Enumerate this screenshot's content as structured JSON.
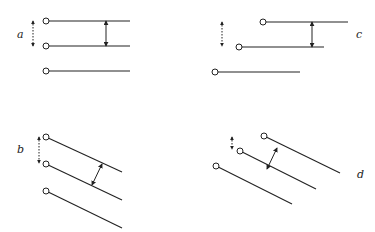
{
  "panels": [
    {
      "id": "a",
      "label": "a",
      "orientation": "horizontal",
      "offset": "aligned",
      "pins": [
        [
          46,
          21,
          130,
          21
        ],
        [
          46,
          46,
          130,
          46
        ],
        [
          46,
          71,
          130,
          71
        ]
      ],
      "dotted_arrow": [
        33,
        21,
        33,
        46
      ],
      "arrow": [
        106,
        21,
        106,
        46
      ],
      "label_pos": [
        17,
        38
      ]
    },
    {
      "id": "c",
      "label": "c",
      "orientation": "horizontal",
      "offset": "staggered",
      "pins": [
        [
          263,
          22,
          348,
          22
        ],
        [
          239,
          47,
          324,
          47
        ],
        [
          215,
          72,
          300,
          72
        ]
      ],
      "dotted_arrow": [
        222,
        22,
        222,
        46
      ],
      "arrow": [
        312,
        22,
        312,
        47
      ],
      "label_pos": [
        356,
        38
      ]
    },
    {
      "id": "b",
      "label": "b",
      "orientation": "diagonal",
      "offset": "aligned",
      "pins": [
        [
          46,
          137,
          122,
          172
        ],
        [
          46,
          164,
          122,
          200
        ],
        [
          46,
          191,
          122,
          228
        ]
      ],
      "dotted_arrow": [
        39,
        137,
        39,
        163
      ],
      "arrow": [
        92,
        185,
        102,
        164
      ],
      "label_pos": [
        17,
        153
      ]
    },
    {
      "id": "d",
      "label": "d",
      "orientation": "diagonal",
      "offset": "staggered",
      "pins": [
        [
          264,
          136,
          340,
          173
        ],
        [
          240,
          151,
          316,
          189
        ],
        [
          216,
          166,
          292,
          204
        ]
      ],
      "dotted_arrow": [
        232,
        137,
        232,
        149
      ],
      "arrow": [
        277,
        148,
        267,
        169
      ],
      "label_pos": [
        357,
        178
      ]
    }
  ],
  "colors": {
    "stroke": "#222222",
    "background": "#ffffff"
  }
}
